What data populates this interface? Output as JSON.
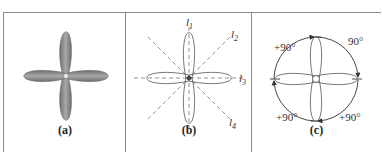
{
  "figure": {
    "panels": [
      {
        "id": "a",
        "caption": "(a)",
        "description": "Solid gray four-lobed rosette (two orthogonal dumbbell lobes)",
        "fill_color": "#8c8c8c"
      },
      {
        "id": "b",
        "caption": "(b)",
        "description": "Outlined four-lobed rosette with dashed symmetry axes",
        "axes": [
          {
            "label": "l",
            "sub": "1",
            "orientation": "vertical"
          },
          {
            "label": "l",
            "sub": "2",
            "orientation": "diagonal-up-right"
          },
          {
            "label": "l",
            "sub": "3",
            "orientation": "horizontal"
          },
          {
            "label": "l",
            "sub": "4",
            "orientation": "diagonal-down-right"
          }
        ]
      },
      {
        "id": "c",
        "caption": "(c)",
        "description": "Outlined four-lobed rosette inside circle with rotation arrows",
        "rotation_labels": [
          "+90°",
          "90°",
          "+90°",
          "+90°"
        ]
      }
    ],
    "colors": {
      "border": "#8a8a8a",
      "lobe_fill": "#8c8c8c",
      "line": "#555555",
      "dash": "#777777"
    }
  }
}
